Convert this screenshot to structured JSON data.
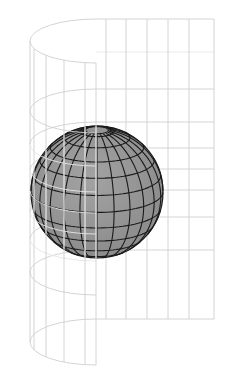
{
  "figure": {
    "title": "",
    "width": 229,
    "height": 380,
    "colors": {
      "background": "#ffffff",
      "surface_grid": "#cfcfcf",
      "sphere_fill": "#a3a3a3",
      "sphere_shade": "#8a8a8a",
      "sphere_graticule": "#1a1a1a",
      "front_grid_over_sphere": "#e6e6e6"
    }
  },
  "surface": {
    "seam_x": 96,
    "left_x": 30,
    "right_x": 214,
    "curved_verticals_x": [
      34,
      46,
      64,
      85
    ],
    "flat_verticals_x": [
      106,
      126,
      147,
      168,
      189
    ],
    "rings": [
      {
        "back_y": 19,
        "side_y": 41,
        "front_y": 63
      },
      {
        "back_y": 89,
        "side_y": 111,
        "front_y": 133
      },
      {
        "back_y": 122,
        "side_y": 144,
        "front_y": 166
      },
      {
        "back_y": 148,
        "side_y": 170,
        "front_y": 192
      },
      {
        "back_y": 169,
        "side_y": 191,
        "front_y": 213
      },
      {
        "back_y": 190,
        "side_y": 212,
        "front_y": 234
      },
      {
        "back_y": 217,
        "side_y": 239,
        "front_y": 261
      },
      {
        "back_y": 250,
        "side_y": 272,
        "front_y": 295
      },
      {
        "back_y": 319,
        "side_y": 342,
        "front_y": 365
      }
    ],
    "extra_flat_rows_y": [
      52
    ]
  },
  "sphere": {
    "cx": 97,
    "cy": 192,
    "r": 66,
    "tilt_deg": 18,
    "parallels_lat_deg": [
      -75,
      -60,
      -45,
      -30,
      -15,
      0,
      15,
      30,
      45,
      60,
      75
    ],
    "meridian_step_deg": 15,
    "polar_cap_lat_deg": 80
  }
}
